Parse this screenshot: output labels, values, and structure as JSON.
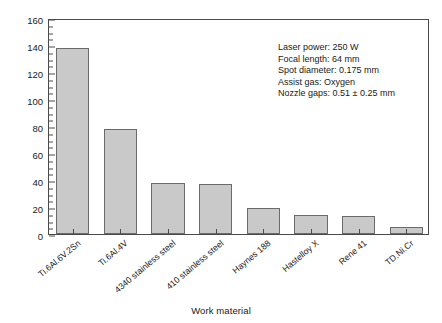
{
  "chart_data": {
    "type": "bar",
    "title": "",
    "xlabel": "Work material",
    "ylabel": "Cutting rate, mm²/s",
    "ylabel_text": "Cutting rate, mm",
    "ylabel_sup": "2",
    "ylabel_tail": "/s",
    "categories": [
      "Ti.6Al.6V.2Sn",
      "Ti.6Al.4V",
      "4340 stainless steel",
      "410 stainless steel",
      "Haynes 188",
      "Hastelloy X",
      "Rene 41",
      "TD.Ni.Cr"
    ],
    "values": [
      137.5,
      78,
      38,
      37,
      19,
      14,
      13.5,
      5
    ],
    "ylim": [
      0,
      160
    ],
    "yticks": [
      0,
      20,
      40,
      60,
      80,
      100,
      120,
      140,
      160
    ],
    "ytick_labels": [
      "0",
      "20",
      "40",
      "60",
      "80",
      "100",
      "120",
      "140",
      "160"
    ],
    "minor_tick_interval": 5,
    "grid": false,
    "legend": false,
    "bar_color": "#c9c9c9",
    "bar_edge_color": "#6b6b6b",
    "axis_color": "#4a4a4a",
    "annotations": [
      "Laser power: 250 W",
      "Focal length: 64 mm",
      "Spot diameter: 0.175 mm",
      "Assist gas: Oxygen",
      "Nozzle gaps: 0.51 ± 0.25 mm"
    ]
  }
}
